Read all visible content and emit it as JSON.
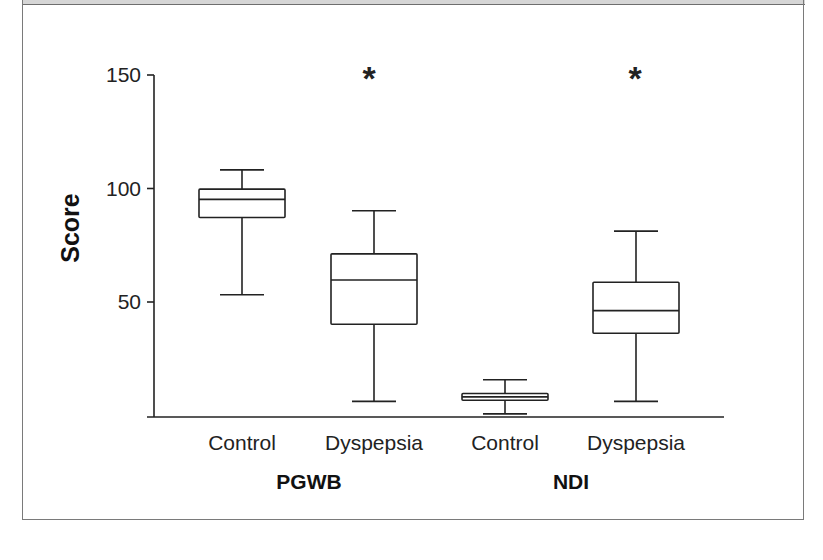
{
  "chart_data": {
    "type": "box",
    "title": "",
    "xlabel": "",
    "ylabel": "Score",
    "ylim": [
      0,
      150
    ],
    "yticks": [
      50,
      100,
      150
    ],
    "grid": false,
    "legend": null,
    "groups": [
      {
        "label": "PGWB",
        "categories": [
          "Control",
          "Dyspepsia"
        ]
      },
      {
        "label": "NDI",
        "categories": [
          "Control",
          "Dyspepsia"
        ]
      }
    ],
    "series": [
      {
        "group": "PGWB",
        "category": "Control",
        "whisker_low": 53,
        "q1": 87,
        "median": 95,
        "q3": 99.5,
        "whisker_high": 108,
        "significant": false
      },
      {
        "group": "PGWB",
        "category": "Dyspepsia",
        "whisker_low": 6,
        "q1": 40,
        "median": 59.5,
        "q3": 71,
        "whisker_high": 90,
        "significant": true
      },
      {
        "group": "NDI",
        "category": "Control",
        "whisker_low": 0.5,
        "q1": 6.5,
        "median": 8,
        "q3": 9.5,
        "whisker_high": 15.5,
        "significant": false
      },
      {
        "group": "NDI",
        "category": "Dyspepsia",
        "whisker_low": 6,
        "q1": 36,
        "median": 46,
        "q3": 58.5,
        "whisker_high": 81,
        "significant": true
      }
    ],
    "annotations": [
      {
        "text": "*",
        "target": "PGWB Dyspepsia"
      },
      {
        "text": "*",
        "target": "NDI Dyspepsia"
      }
    ]
  },
  "labels": {
    "ylabel": "Score",
    "yticks": [
      "50",
      "100",
      "150"
    ],
    "categories": [
      "Control",
      "Dyspepsia",
      "Control",
      "Dyspepsia"
    ],
    "groups": [
      "PGWB",
      "NDI"
    ],
    "significance_marker": "*"
  },
  "colors": {
    "line": "#222222",
    "border": "#7a7a7a",
    "band": "#d6d6d6",
    "background": "#ffffff"
  }
}
